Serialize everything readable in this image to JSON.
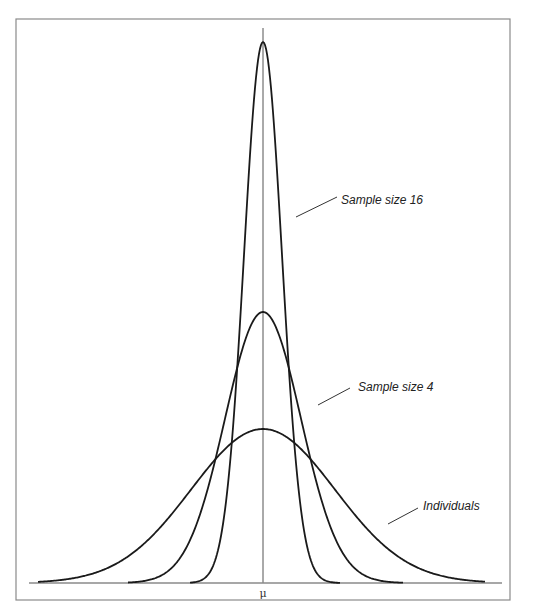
{
  "chart_data": {
    "type": "line",
    "title": "",
    "xlabel": "",
    "ylabel": "",
    "x_tick_labels": [
      "μ"
    ],
    "grid": false,
    "legend": "direct labels with leader lines",
    "series": [
      {
        "name": "Sample size 16",
        "relative_sd": 0.25,
        "relative_peak_height": 3.5
      },
      {
        "name": "Sample size 4",
        "relative_sd": 0.5,
        "relative_peak_height": 1.76
      },
      {
        "name": "Individuals",
        "relative_sd": 1.0,
        "relative_peak_height": 1.0
      }
    ],
    "annotations": [
      "Sample size 16",
      "Sample size 4",
      "Individuals",
      "μ"
    ]
  },
  "labels": {
    "n16": "Sample size 16",
    "n4": "Sample size 4",
    "individuals": "Individuals",
    "mu": "μ"
  }
}
